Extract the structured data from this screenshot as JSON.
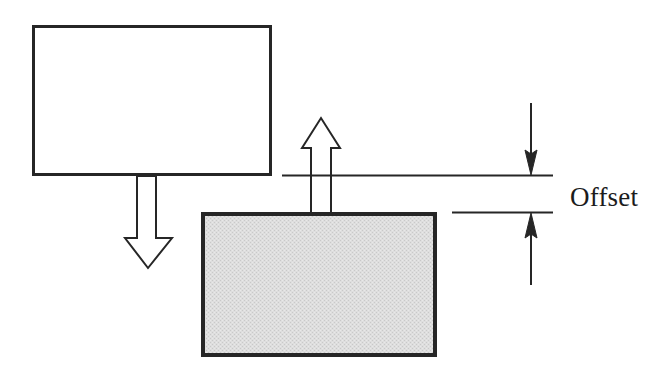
{
  "diagram": {
    "background_color": "#ffffff",
    "stroke_color": "#262626",
    "labels": {
      "offset": "Offset"
    },
    "shapes": {
      "upper_block": {
        "name": "upper-block",
        "fill": "#ffffff",
        "stroke": "#262626",
        "stroke_width": 3,
        "x": 32,
        "y": 25,
        "width": 240,
        "height": 151
      },
      "lower_block": {
        "name": "lower-block",
        "fill": "#d8d8d8",
        "stroke": "#262626",
        "stroke_width": 4,
        "x": 201,
        "y": 212,
        "width": 236,
        "height": 145
      },
      "down_block_arrow": {
        "name": "down-block-arrow",
        "fill": "#ffffff",
        "stroke": "#262626",
        "stroke_width": 2,
        "shaft_left": 137,
        "shaft_right": 156,
        "shaft_top": 176,
        "head_top": 238,
        "head_left": 125,
        "head_right": 172,
        "tip_x": 148,
        "tip_y": 268
      },
      "up_block_arrow": {
        "name": "up-block-arrow",
        "fill": "#ffffff",
        "stroke": "#262626",
        "stroke_width": 2,
        "shaft_left": 311,
        "shaft_right": 331,
        "shaft_bottom": 213,
        "head_bottom": 148,
        "head_left": 302,
        "head_right": 340,
        "tip_x": 321,
        "tip_y": 118
      },
      "upper_reference_line": {
        "name": "upper-reference-line",
        "x1": 282,
        "y1": 175,
        "x2": 553,
        "y2": 175,
        "stroke_width": 2
      },
      "lower_reference_line": {
        "name": "lower-reference-line",
        "x1": 452,
        "y1": 212,
        "x2": 553,
        "y2": 212,
        "stroke_width": 2
      },
      "dimension_arrow_top": {
        "name": "dimension-arrow-down",
        "x": 531,
        "tail_y": 103,
        "tip_y": 175,
        "head_half_width": 6,
        "head_length": 25,
        "stroke_width": 2
      },
      "dimension_arrow_bottom": {
        "name": "dimension-arrow-up",
        "x": 531,
        "tail_y": 285,
        "tip_y": 213,
        "head_half_width": 6,
        "head_length": 25,
        "stroke_width": 2
      }
    }
  }
}
